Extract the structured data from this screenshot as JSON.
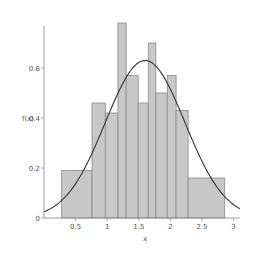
{
  "chart_data": {
    "type": "bar",
    "subtype": "histogram-with-density-curve",
    "title": "",
    "xlabel": "x",
    "ylabel": "f(x)",
    "xlim": [
      0,
      3
    ],
    "ylim": [
      0,
      0.8
    ],
    "grid": false,
    "x_ticks": [
      0.5,
      1,
      1.5,
      2,
      2.5,
      3
    ],
    "x_tick_labels": [
      "0.5",
      "1",
      "1.5",
      "2",
      "2.5",
      "3"
    ],
    "y_ticks": [
      0,
      0.2,
      0.4,
      0.6
    ],
    "y_tick_labels": [
      "0",
      "0.2",
      "0.4",
      "0.6"
    ],
    "bins": [
      {
        "left": 0.28,
        "right": 0.76,
        "height": 0.19
      },
      {
        "left": 0.76,
        "right": 0.97,
        "height": 0.46
      },
      {
        "left": 0.97,
        "right": 1.17,
        "height": 0.42
      },
      {
        "left": 1.17,
        "right": 1.3,
        "height": 0.78
      },
      {
        "left": 1.3,
        "right": 1.49,
        "height": 0.57
      },
      {
        "left": 1.49,
        "right": 1.65,
        "height": 0.46
      },
      {
        "left": 1.65,
        "right": 1.77,
        "height": 0.7
      },
      {
        "left": 1.77,
        "right": 1.95,
        "height": 0.5
      },
      {
        "left": 1.95,
        "right": 2.09,
        "height": 0.57
      },
      {
        "left": 2.09,
        "right": 2.28,
        "height": 0.43
      },
      {
        "left": 2.28,
        "right": 2.86,
        "height": 0.16
      }
    ],
    "curve": {
      "type": "normal-density",
      "mean": 1.6,
      "sd": 0.63,
      "peak": 0.63,
      "x_range": [
        0,
        3.1
      ]
    },
    "colors": {
      "bar_fill": "#c8c8c8",
      "bar_stroke": "#8a8a8a",
      "curve": "#333333",
      "axis": "#888888"
    },
    "layout": {
      "x0_px": 44,
      "y0_px": 218,
      "px_per_x": 63.2,
      "px_per_y": 250
    }
  }
}
